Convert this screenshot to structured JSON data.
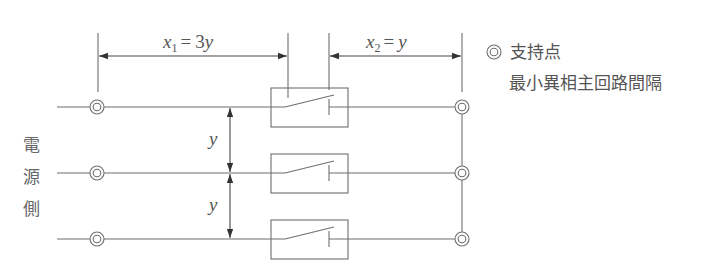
{
  "diagram": {
    "type": "single-line switchgear clearance diagram",
    "source_side_label": [
      "電",
      "源",
      "側"
    ],
    "dimensions": {
      "x1": {
        "var": "x",
        "sub": "1",
        "eq": "= 3y"
      },
      "x2": {
        "var": "x",
        "sub": "2",
        "eq": "= y"
      },
      "y_top": "y",
      "y_bottom": "y"
    },
    "phases": [
      {
        "name": "phase-1",
        "switch": "open breaker"
      },
      {
        "name": "phase-2",
        "switch": "open breaker"
      },
      {
        "name": "phase-3",
        "switch": "open breaker"
      }
    ],
    "legend": {
      "symbol": "◎",
      "symbol_meaning": "支持点",
      "line_meaning": "最小異相主回路間隔"
    },
    "colors": {
      "line": "#6e6e6e",
      "arrow": "#333333",
      "text": "#555555"
    }
  }
}
